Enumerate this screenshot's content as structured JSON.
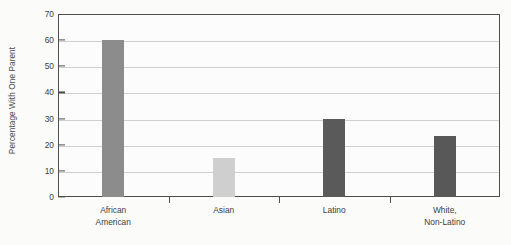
{
  "chart_data": {
    "type": "bar",
    "title": "",
    "subtitle": "",
    "xlabel": "",
    "ylabel": "Percentage With One Parent",
    "categories": [
      "African American",
      "Asian",
      "Latino",
      "White, Non-Latino"
    ],
    "category_lines": [
      [
        "African",
        "American"
      ],
      [
        "Asian",
        ""
      ],
      [
        "Latino",
        ""
      ],
      [
        "White,",
        "Non-Latino"
      ]
    ],
    "values": [
      60,
      15,
      30,
      23.5
    ],
    "bar_colors": [
      "#8c8c8c",
      "#cfcfcf",
      "#5a5a5a",
      "#585858"
    ],
    "ylim": [
      0,
      70
    ],
    "yticks": [
      0,
      10,
      20,
      30,
      40,
      50,
      60,
      70
    ],
    "ytick_labels": [
      "0",
      "10",
      "20",
      "30",
      "40",
      "50",
      "60",
      "70"
    ],
    "grid": true,
    "grid_axis": "y",
    "legend": "none",
    "frame": true,
    "plot_background": "#fcfcfc",
    "figure_background": "#fbfbfa",
    "axis_color": "#4e4e4e",
    "grid_color": "#cfcfcf"
  }
}
